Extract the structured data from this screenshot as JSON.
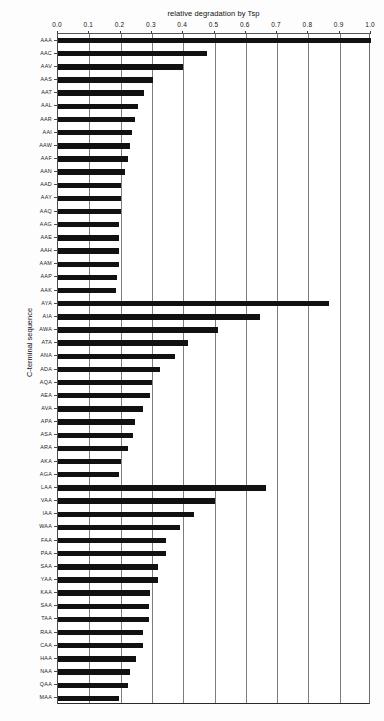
{
  "chart_data": {
    "type": "bar",
    "orientation": "horizontal",
    "title": "relative degradation by Tsp",
    "xlabel": "relative degradation by Tsp",
    "ylabel": "C-terminal sequence",
    "xlim": [
      0.0,
      1.0
    ],
    "xticks": [
      0.0,
      0.1,
      0.2,
      0.3,
      0.4,
      0.5,
      0.6,
      0.7,
      0.8,
      0.9,
      1.0
    ],
    "xtick_labels": [
      "0.0",
      "0.1",
      "0.2",
      "0.3",
      "0.4",
      "0.5",
      "0.6",
      "0.7",
      "0.8",
      "0.9",
      "1.0"
    ],
    "grid": "vertical",
    "legend": "none",
    "bar_color": "#111111",
    "axis_position": "top",
    "categories": [
      "AAA",
      "AAC",
      "AAV",
      "AAS",
      "AAT",
      "AAL",
      "AAR",
      "AAI",
      "AAW",
      "AAF",
      "AAN",
      "AAD",
      "AAY",
      "AAQ",
      "AAG",
      "AAE",
      "AAH",
      "AAM",
      "AAP",
      "AAK",
      "AYA",
      "AIA",
      "AWA",
      "ATA",
      "ANA",
      "ADA",
      "AQA",
      "AEA",
      "AVA",
      "APA",
      "ASA",
      "ARA",
      "AKA",
      "AGA",
      "LAA",
      "VAA",
      "IAA",
      "WAA",
      "FAA",
      "PAA",
      "SAA",
      "YAA",
      "KAA",
      "SAA",
      "TAA",
      "RAA",
      "CAA",
      "HAA",
      "NAA",
      "QAA",
      "MAA"
    ],
    "values": [
      1.0,
      0.475,
      0.4,
      0.305,
      0.275,
      0.255,
      0.245,
      0.235,
      0.23,
      0.225,
      0.215,
      0.2,
      0.2,
      0.2,
      0.195,
      0.195,
      0.195,
      0.195,
      0.19,
      0.185,
      0.865,
      0.645,
      0.51,
      0.415,
      0.375,
      0.325,
      0.3,
      0.295,
      0.27,
      0.245,
      0.24,
      0.225,
      0.2,
      0.195,
      0.665,
      0.5,
      0.435,
      0.39,
      0.345,
      0.345,
      0.32,
      0.32,
      0.295,
      0.29,
      0.29,
      0.27,
      0.27,
      0.25,
      0.23,
      0.225,
      0.195
    ],
    "groups": [
      {
        "name": "AAx series",
        "start": 0,
        "count": 20
      },
      {
        "name": "AxA series",
        "start": 20,
        "count": 14
      },
      {
        "name": "xAA series",
        "start": 34,
        "count": 17
      }
    ]
  }
}
